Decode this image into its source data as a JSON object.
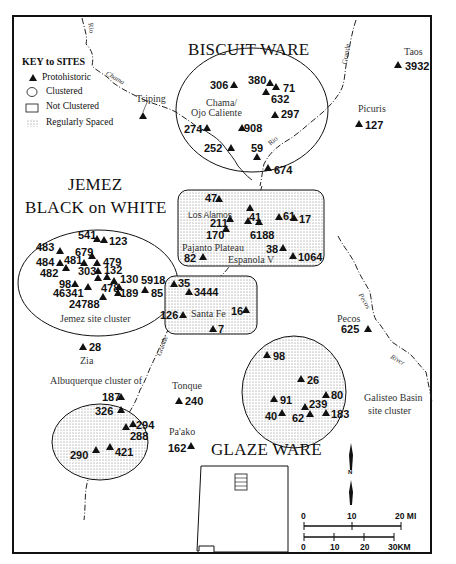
{
  "key": {
    "title": "KEY to SITES",
    "items": [
      {
        "symbol": "triangle",
        "label": "Protohistoric"
      },
      {
        "symbol": "circle",
        "label": "Clustered"
      },
      {
        "symbol": "rectangle",
        "label": "Not Clustered"
      },
      {
        "symbol": "dotted",
        "label": "Regularly Spaced"
      }
    ]
  },
  "regions": {
    "biscuit": "BISCUIT WARE",
    "jemez1": "JEMEZ",
    "jemez2": "BLACK on WHITE",
    "glaze": "GLAZE WARE"
  },
  "places": {
    "tsiping": "Tsiping",
    "chama": "Chama/",
    "ojo": "Ojo Caliente",
    "taos": "Taos",
    "picuris": "Picuris",
    "los_alamos": "Los Alamos",
    "pajarito": "Pajanto Plateau",
    "espanola": "Espanola V",
    "jemez_cluster": "Jemez site cluster",
    "santa_fe": "Santa Fe",
    "pecos": "Pecos",
    "zia": "Zia",
    "albuquerque": "Albuquerque cluster of",
    "tonque": "Tonque",
    "paako": "Pa'ako",
    "galisteo1": "Galisteo Basin",
    "galisteo2": "site cluster"
  },
  "rivers": {
    "rio1": "Rio",
    "chama": "Chama",
    "grande_n": "Grande",
    "rio2": "Rio",
    "grande_s": "Grande",
    "pecos": "Pecos",
    "river": "River"
  },
  "sites": {
    "s306": "306",
    "s380": "380",
    "s71": "71",
    "s632": "632",
    "s297": "297",
    "s274": "274",
    "s908": "908",
    "s252": "252",
    "s59": "59",
    "s674": "674",
    "s3932": "3932",
    "s127": "127",
    "s47": "47",
    "s211": "211",
    "s41": "41",
    "s61": "61",
    "s17": "17",
    "s170": "170",
    "s6188": "6188",
    "s38": "38",
    "s82": "82",
    "s1064": "1064",
    "s541": "541",
    "s123": "123",
    "s483": "483",
    "s679": "679",
    "s484": "484",
    "s481": "481",
    "s479": "479",
    "s482": "482",
    "s303": "303",
    "s132": "132",
    "s130": "130",
    "s5918": "5918",
    "s98a": "98",
    "s478": "478",
    "s85": "85",
    "s46341": "46341",
    "s189": "189",
    "s24788": "24788",
    "s35": "35",
    "s3444": "3444",
    "s126": "126",
    "s16": "16",
    "s7": "7",
    "s625": "625",
    "s28": "28",
    "s187": "187",
    "s326": "326",
    "s294": "294",
    "s288": "288",
    "s290": "290",
    "s421": "421",
    "s240": "240",
    "s162": "162",
    "s98b": "98",
    "s26": "26",
    "s91": "91",
    "s80": "80",
    "s239": "239",
    "s40": "40",
    "s62": "62",
    "s183": "183"
  },
  "scale": {
    "mi": [
      "0",
      "10",
      "20 MI"
    ],
    "km": [
      "0",
      "10",
      "20",
      "30KM"
    ],
    "north": "N"
  }
}
